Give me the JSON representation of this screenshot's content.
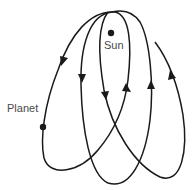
{
  "diagram": {
    "labels": {
      "sun": "Sun",
      "planet": "Planet"
    },
    "colors": {
      "line": "#1a1a1a",
      "text": "#4a4a4a",
      "background": "#ffffff"
    }
  }
}
